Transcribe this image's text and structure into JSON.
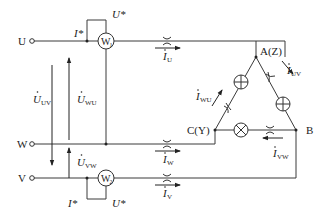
{
  "diagram": {
    "terminals": [
      {
        "id": "U",
        "label": "U"
      },
      {
        "id": "W",
        "label": "W"
      },
      {
        "id": "V",
        "label": "V"
      }
    ],
    "wattmeters": [
      {
        "id": "W1",
        "label": "W",
        "sub": "1",
        "current_mark": "I*",
        "voltage_mark": "U*"
      },
      {
        "id": "W2",
        "label": "W",
        "sub": "2",
        "current_mark": "I*",
        "voltage_mark": "U*"
      }
    ],
    "voltages": [
      {
        "id": "UUV",
        "main": "U",
        "sub": "UV"
      },
      {
        "id": "UWU",
        "main": "U",
        "sub": "WU"
      },
      {
        "id": "UVW",
        "main": "U",
        "sub": "VW"
      }
    ],
    "line_currents": [
      {
        "id": "IU",
        "main": "I",
        "sub": "U"
      },
      {
        "id": "IW",
        "main": "I",
        "sub": "W"
      },
      {
        "id": "IV",
        "main": "I",
        "sub": "V"
      }
    ],
    "phase_currents": [
      {
        "id": "IUV",
        "main": "I",
        "sub": "UV"
      },
      {
        "id": "IWU",
        "main": "I",
        "sub": "WU"
      },
      {
        "id": "IVW",
        "main": "I",
        "sub": "VW"
      }
    ],
    "nodes": [
      {
        "id": "A",
        "label": "A(Z)"
      },
      {
        "id": "B",
        "label": "B"
      },
      {
        "id": "C",
        "label": "C(Y)"
      }
    ],
    "load_type": "lamp-delta"
  }
}
